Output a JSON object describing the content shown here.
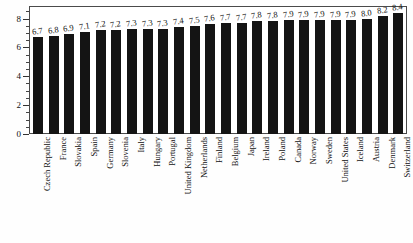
{
  "chart_data": {
    "type": "bar",
    "title": "",
    "subtitle": "",
    "xlabel": "",
    "ylabel": "",
    "ylim": [
      0,
      8.8
    ],
    "yticks": [
      0,
      2,
      4,
      6,
      8
    ],
    "ytick_labels": [
      "0",
      "2",
      "4",
      "6",
      "8"
    ],
    "yminor_step": 0.5,
    "grid": false,
    "legend": null,
    "bar_color": "#141414",
    "frame_color": "#4a4a4a",
    "value_labels_shown": true,
    "categories": [
      "Czech Republic",
      "France",
      "Slovakia",
      "Spain",
      "Germany",
      "Slovenia",
      "Italy",
      "Hungary",
      "Portugal",
      "United Kingdom",
      "Netherlands",
      "Finland",
      "Belgium",
      "Japan",
      "Ireland",
      "Poland",
      "Canada",
      "Norway",
      "Sweden",
      "United States",
      "Iceland",
      "Austria",
      "Denmark",
      "Switzerland"
    ],
    "values": [
      6.7,
      6.8,
      6.9,
      7.1,
      7.2,
      7.2,
      7.3,
      7.3,
      7.3,
      7.4,
      7.5,
      7.6,
      7.7,
      7.7,
      7.8,
      7.8,
      7.9,
      7.9,
      7.9,
      7.9,
      7.9,
      8.0,
      8.2,
      8.4
    ],
    "value_label_texts": [
      "6.7",
      "6.8",
      "6.9",
      "7.1",
      "7.2",
      "7.2",
      "7.3",
      "7.3",
      "7.3",
      "7.4",
      "7.5",
      "7.6",
      "7.7",
      "7.7",
      "7.8",
      "7.8",
      "7.9",
      "7.9",
      "7.9",
      "7.9",
      "7.9",
      "8.0",
      "8.2",
      "8.4"
    ]
  }
}
